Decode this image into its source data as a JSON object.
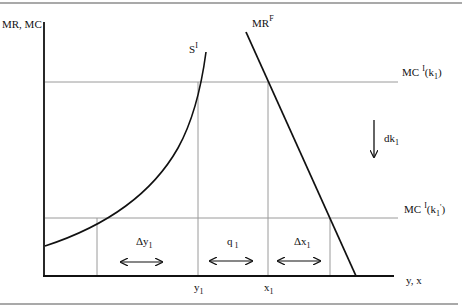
{
  "diagram": {
    "axes": {
      "y_label": "MR, MC",
      "x_label": "y, x"
    },
    "curves": {
      "supply": {
        "label": "S",
        "superscript": "I"
      },
      "marginal_revenue": {
        "label": "MR",
        "superscript": "F"
      }
    },
    "levels": {
      "upper": {
        "label": "MC",
        "superscript": "I",
        "arg": "(k",
        "arg_sub": "1",
        "arg_end": ")"
      },
      "lower": {
        "label": "MC",
        "superscript": "I",
        "arg": "(k",
        "arg_sub": "1",
        "arg_prime": "'",
        "arg_end": ")"
      }
    },
    "shift": {
      "label": "dk",
      "sub": "1"
    },
    "x_ticks": [
      {
        "label": "y",
        "sub": "1"
      },
      {
        "label": "x",
        "sub": "1"
      }
    ],
    "intervals": [
      {
        "label": "Δy",
        "sub": "1"
      },
      {
        "label": "q",
        "sub": "1"
      },
      {
        "label": "Δx",
        "sub": "1"
      }
    ],
    "colors": {
      "ink": "#111111",
      "guide": "#9a9a9a",
      "rule": "#555555"
    }
  }
}
